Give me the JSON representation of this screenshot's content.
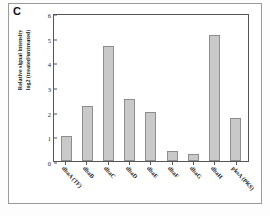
{
  "figure": {
    "panel_letter": "C"
  },
  "chart_data": {
    "type": "bar",
    "title": "",
    "xlabel": "",
    "ylabel": "Relative signal intensity log2 (treated/untreated)",
    "ylabel_lines": [
      "Relative signal intensity",
      "log2 (treated/untreated)"
    ],
    "ylim": [
      0,
      6
    ],
    "yticks": [
      0,
      1,
      2,
      3,
      4,
      5,
      6
    ],
    "ytick_labels": [
      "0",
      "1",
      "2",
      "3",
      "4",
      "5",
      "6"
    ],
    "grid": false,
    "legend": "none",
    "bar_color": "#c9c9c9",
    "bar_edge_color": "#8d8d8d",
    "categories": [
      "dbaA (TF)",
      "dbaB",
      "dbaC",
      "dbaD",
      "dbaE",
      "dbaF",
      "dbaG",
      "dbaH",
      "pksA (PKS)"
    ],
    "values": [
      1.0,
      2.25,
      4.65,
      2.5,
      2.0,
      0.4,
      0.3,
      5.1,
      1.75
    ]
  }
}
